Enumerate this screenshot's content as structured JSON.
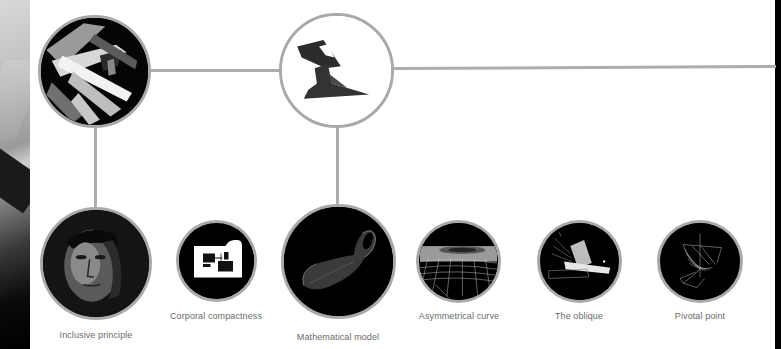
{
  "diagram": {
    "colors": {
      "background": "#ffffff",
      "connector": "#adadad",
      "node_border": "#a9a9a9",
      "node_fill": "#000000",
      "label_text": "#6a6a6a"
    },
    "top_nodes": [
      {
        "id": "top-left",
        "image": "abstract-architectural-render",
        "fill": "dark"
      },
      {
        "id": "top-center",
        "image": "dark-sculptural-form",
        "fill": "white"
      }
    ],
    "nodes": [
      {
        "id": "inclusive",
        "label": "Inclusive principle",
        "image": "face-portrait"
      },
      {
        "id": "corporal",
        "label": "Corporal compactness",
        "image": "floor-plan-block"
      },
      {
        "id": "mathematical",
        "label": "Mathematical model",
        "image": "klein-bottle-form"
      },
      {
        "id": "asymmetrical",
        "label": "Asymmetrical curve",
        "image": "wireframe-grid-surface"
      },
      {
        "id": "oblique",
        "label": "The oblique",
        "image": "oblique-light-planes"
      },
      {
        "id": "pivotal",
        "label": "Pivotal point",
        "image": "wireframe-twisted-ribbon"
      }
    ]
  }
}
